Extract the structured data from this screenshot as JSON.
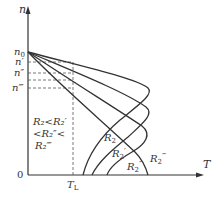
{
  "diagram": {
    "axes": {
      "y_label": "n",
      "x_label": "T",
      "origin_label": "0"
    },
    "speed_marks": [
      "n0",
      "n'",
      "n''",
      "n'''"
    ],
    "speed_marks_display": {
      "n0": "n",
      "n0_sub": "0",
      "n1": "n′",
      "n2": "n″",
      "n3": "n‴"
    },
    "load_torque": {
      "label": "T",
      "sub": "L"
    },
    "curves": [
      {
        "name": "R2",
        "display": "R",
        "sub": "2",
        "prime": ""
      },
      {
        "name": "R2'",
        "display": "R",
        "sub": "2",
        "prime": "′"
      },
      {
        "name": "R2''",
        "display": "R",
        "sub": "2",
        "prime": "″"
      },
      {
        "name": "R2'''",
        "display": "R",
        "sub": "2",
        "prime": "‴"
      }
    ],
    "inequality": {
      "line1": "R₂<R₂′",
      "line2": "<R₂″<",
      "line3": "R₂‴"
    }
  },
  "colors": {
    "line": "#333333",
    "dashed": "#555555",
    "background": "#ffffff"
  }
}
